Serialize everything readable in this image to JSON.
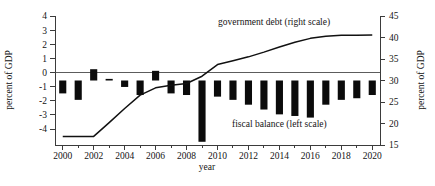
{
  "chart_data": {
    "type": "bar",
    "title": "",
    "xlabel": "year",
    "ylabel": "percent of GDP",
    "ylabel_right": "percent of GDP",
    "ylim": [
      -4,
      4
    ],
    "ylim_right": [
      15,
      45
    ],
    "yticks": [
      -4,
      -3,
      -2,
      -1,
      0,
      1,
      2,
      3,
      4
    ],
    "yticks_right": [
      15,
      20,
      25,
      30,
      35,
      40,
      45
    ],
    "grid": false,
    "legend_position": "inline-annotations",
    "categories": [
      "2000",
      "2001",
      "2002",
      "2003",
      "2004",
      "2005",
      "2006",
      "2007",
      "2008",
      "2009",
      "2010",
      "2011",
      "2012",
      "2013",
      "2014",
      "2015",
      "2016",
      "2017",
      "2018",
      "2019",
      "2020"
    ],
    "xticks": [
      "2000",
      "2002",
      "2004",
      "2006",
      "2008",
      "2010",
      "2012",
      "2014",
      "2016",
      "2018",
      "2020"
    ],
    "series": [
      {
        "name": "fiscal balance (left scale)",
        "type": "bar",
        "axis": "left",
        "color": "#0b0b0b",
        "values": [
          -0.8,
          -1.2,
          0.7,
          0.1,
          -0.4,
          -0.9,
          0.6,
          -0.8,
          -0.9,
          -3.8,
          -1.0,
          -1.2,
          -1.5,
          -1.8,
          -2.1,
          -2.2,
          -2.3,
          -1.5,
          -1.2,
          -1.1,
          -0.9
        ]
      },
      {
        "name": "government debt (right scale)",
        "type": "line",
        "axis": "right",
        "color": "#111111",
        "values": [
          17.0,
          17.0,
          17.0,
          20.2,
          23.5,
          26.6,
          28.3,
          28.9,
          29.3,
          31.0,
          33.7,
          34.6,
          35.5,
          36.6,
          37.8,
          38.9,
          39.8,
          40.3,
          40.5,
          40.5,
          40.6
        ]
      }
    ],
    "annotations": [
      {
        "text": "government debt (right scale)",
        "x": 2010.5,
        "y_right": 43.2
      },
      {
        "text": "fiscal balance (left scale)",
        "x": 2014.8,
        "y_left": -2.75
      }
    ]
  },
  "axes": {
    "left_title": "percent of GDP",
    "right_title": "percent of GDP",
    "x_title": "year"
  },
  "legend": {
    "debt_label": "government debt (right scale)",
    "balance_label": "fiscal balance (left scale)"
  },
  "tick_labels": {
    "left": [
      "4",
      "3",
      "2",
      "1",
      "0",
      "-1",
      "-2",
      "-3",
      "-4"
    ],
    "right": [
      "45",
      "40",
      "35",
      "30",
      "25",
      "20",
      "15"
    ],
    "bottom": [
      "2000",
      "2002",
      "2004",
      "2006",
      "2008",
      "2010",
      "2012",
      "2014",
      "2016",
      "2018",
      "2020"
    ]
  },
  "colors": {
    "bar": "#0b0b0b",
    "line": "#111111",
    "axis": "#3b3b3b",
    "text": "#141414",
    "background": "#ffffff"
  }
}
